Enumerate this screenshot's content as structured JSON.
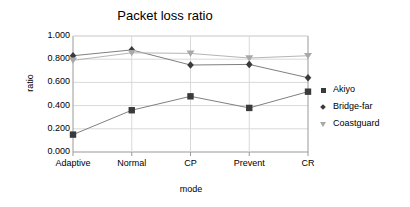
{
  "chart_data": {
    "type": "line",
    "title": "Packet loss ratio",
    "xlabel": "mode",
    "ylabel": "ratio",
    "categories": [
      "Adaptive",
      "Normal",
      "CP",
      "Prevent",
      "CR"
    ],
    "ylim": [
      0.0,
      1.0
    ],
    "yticks": [
      "0.000",
      "0.200",
      "0.400",
      "0.600",
      "0.800",
      "1.000"
    ],
    "ytick_values": [
      0.0,
      0.2,
      0.4,
      0.6,
      0.8,
      1.0
    ],
    "grid": true,
    "legend_position": "right",
    "series": [
      {
        "name": "Akiyo",
        "marker": "square",
        "color": "#3a3a3a",
        "line_color": "#808080",
        "values": [
          0.15,
          0.36,
          0.48,
          0.38,
          0.52
        ]
      },
      {
        "name": "Bridge-far",
        "marker": "diamond",
        "color": "#3a3a3a",
        "line_color": "#808080",
        "values": [
          0.83,
          0.88,
          0.75,
          0.755,
          0.64
        ]
      },
      {
        "name": "Coastguard",
        "marker": "triangle-down",
        "color": "#a8a8a8",
        "line_color": "#b5b5b5",
        "values": [
          0.79,
          0.855,
          0.85,
          0.81,
          0.83
        ]
      }
    ]
  },
  "axis_color": "#999999",
  "grid_color": "#d9d9d9",
  "background": "#ffffff"
}
